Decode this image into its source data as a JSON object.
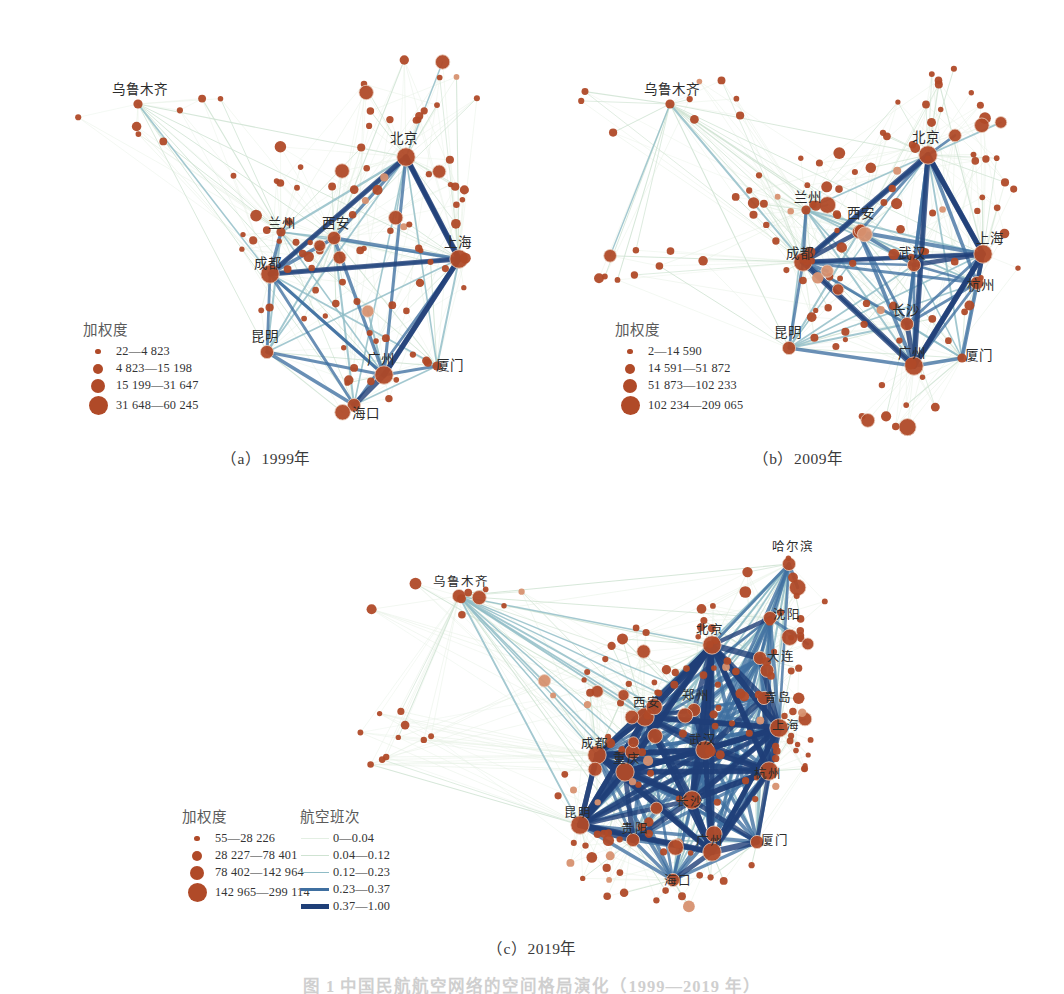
{
  "figure": {
    "caption": "图 1   中国民航航空网络的空间格局演化（1999—2019 年）",
    "panels": [
      {
        "id": "a",
        "caption": "（a）1999年",
        "year": 1999
      },
      {
        "id": "b",
        "caption": "（b）2009年",
        "year": 2009
      },
      {
        "id": "c",
        "caption": "（c）2019年",
        "year": 2019
      }
    ]
  },
  "colors": {
    "node_fill": "#b04a28",
    "node_fill_light": "#d79170",
    "edge_weak": "#cfe3d2",
    "edge_mid": "#8fbcc6",
    "edge_strong": "#3f6fa0",
    "edge_max": "#1f3f78",
    "label_text": "#2b2b2b",
    "legend_text": "#333333",
    "caption_text": "#3a3a3a"
  },
  "legends": {
    "panel_a": {
      "title": "加权度",
      "classes": [
        {
          "label": "22—4 823",
          "radius": 2.8,
          "min": 22,
          "max": 4823
        },
        {
          "label": "4 823—15 198",
          "radius": 5.0,
          "min": 4823,
          "max": 15198
        },
        {
          "label": "15 199—31 647",
          "radius": 7.0,
          "min": 15199,
          "max": 31647
        },
        {
          "label": "31 648—60 245",
          "radius": 9.5,
          "min": 31648,
          "max": 60245
        }
      ]
    },
    "panel_b": {
      "title": "加权度",
      "classes": [
        {
          "label": "2—14 590",
          "radius": 2.8,
          "min": 2,
          "max": 14590
        },
        {
          "label": "14 591—51 872",
          "radius": 5.0,
          "min": 14591,
          "max": 51872
        },
        {
          "label": "51 873—102 233",
          "radius": 7.0,
          "min": 51873,
          "max": 102233
        },
        {
          "label": "102 234—209 065",
          "radius": 9.5,
          "min": 102234,
          "max": 209065
        }
      ]
    },
    "panel_c_nodes": {
      "title": "加权度",
      "classes": [
        {
          "label": "55—28 226",
          "radius": 2.8,
          "min": 55,
          "max": 28226
        },
        {
          "label": "28 227—78 401",
          "radius": 5.0,
          "min": 28227,
          "max": 78401
        },
        {
          "label": "78 402—142 964",
          "radius": 7.0,
          "min": 78402,
          "max": 142964
        },
        {
          "label": "142 965—299 114",
          "radius": 9.5,
          "min": 142965,
          "max": 299114
        }
      ]
    },
    "panel_c_edges": {
      "title": "航空班次",
      "classes": [
        {
          "label": "0—0.04",
          "width": 0.7,
          "color": "#e3efe3",
          "min": 0,
          "max": 0.04
        },
        {
          "label": "0.04—0.12",
          "width": 1.1,
          "color": "#cfe3d2",
          "min": 0.04,
          "max": 0.12
        },
        {
          "label": "0.12—0.23",
          "width": 1.8,
          "color": "#8fbcc6",
          "min": 0.12,
          "max": 0.23
        },
        {
          "label": "0.23—0.37",
          "width": 3.4,
          "color": "#3f6fa0",
          "min": 0.23,
          "max": 0.37
        },
        {
          "label": "0.37—1.00",
          "width": 5.4,
          "color": "#1f3f78",
          "min": 0.37,
          "max": 1.0
        }
      ]
    }
  },
  "chart_data": {
    "type": "scatter",
    "title": "中国民航航空网络的空间格局演化（1999—2019 年）",
    "xlabel": "",
    "ylabel": "",
    "grid": false,
    "legend_position": "lower-left",
    "panels": [
      {
        "id": "a",
        "label": "（a）1999年",
        "labeled_cities": [
          {
            "name": "乌鲁木齐",
            "x": 138,
            "y": 104,
            "deg_class": 2,
            "lx": 140,
            "ly": 94,
            "anchor": "middle"
          },
          {
            "name": "北京",
            "x": 406,
            "y": 157,
            "deg_class": 4,
            "lx": 404,
            "ly": 143,
            "anchor": "middle"
          },
          {
            "name": "兰州",
            "x": 281,
            "y": 232,
            "deg_class": 2,
            "lx": 282,
            "ly": 228,
            "anchor": "middle"
          },
          {
            "name": "西安",
            "x": 334,
            "y": 238,
            "deg_class": 3,
            "lx": 336,
            "ly": 228,
            "anchor": "middle"
          },
          {
            "name": "成都",
            "x": 270,
            "y": 274,
            "deg_class": 4,
            "lx": 268,
            "ly": 268,
            "anchor": "middle"
          },
          {
            "name": "上海",
            "x": 459,
            "y": 259,
            "deg_class": 4,
            "lx": 458,
            "ly": 247,
            "anchor": "middle"
          },
          {
            "name": "昆明",
            "x": 267,
            "y": 352,
            "deg_class": 3,
            "lx": 265,
            "ly": 341,
            "anchor": "middle"
          },
          {
            "name": "广州",
            "x": 384,
            "y": 375,
            "deg_class": 4,
            "lx": 381,
            "ly": 364,
            "anchor": "middle"
          },
          {
            "name": "厦门",
            "x": 437,
            "y": 366,
            "deg_class": 2,
            "lx": 450,
            "ly": 370,
            "anchor": "middle"
          },
          {
            "name": "海口",
            "x": 354,
            "y": 405,
            "deg_class": 3,
            "lx": 366,
            "ly": 418,
            "anchor": "middle"
          }
        ],
        "node_count": 110,
        "edge_count": 520
      },
      {
        "id": "b",
        "label": "（b）2009年",
        "labeled_cities": [
          {
            "name": "乌鲁木齐",
            "x": 670,
            "y": 104,
            "deg_class": 2,
            "lx": 672,
            "ly": 94,
            "anchor": "middle"
          },
          {
            "name": "北京",
            "x": 928,
            "y": 155,
            "deg_class": 4,
            "lx": 926,
            "ly": 142,
            "anchor": "middle"
          },
          {
            "name": "兰州",
            "x": 806,
            "y": 210,
            "deg_class": 2,
            "lx": 808,
            "ly": 202,
            "anchor": "middle"
          },
          {
            "name": "西安",
            "x": 859,
            "y": 232,
            "deg_class": 3,
            "lx": 861,
            "ly": 218,
            "anchor": "middle"
          },
          {
            "name": "成都",
            "x": 803,
            "y": 262,
            "deg_class": 4,
            "lx": 800,
            "ly": 258,
            "anchor": "middle"
          },
          {
            "name": "上海",
            "x": 983,
            "y": 254,
            "deg_class": 4,
            "lx": 990,
            "ly": 243,
            "anchor": "middle"
          },
          {
            "name": "武汉",
            "x": 914,
            "y": 265,
            "deg_class": 3,
            "lx": 912,
            "ly": 258,
            "anchor": "middle"
          },
          {
            "name": "杭州",
            "x": 977,
            "y": 283,
            "deg_class": 3,
            "lx": 981,
            "ly": 290,
            "anchor": "middle"
          },
          {
            "name": "长沙",
            "x": 907,
            "y": 324,
            "deg_class": 3,
            "lx": 906,
            "ly": 315,
            "anchor": "middle"
          },
          {
            "name": "昆明",
            "x": 789,
            "y": 348,
            "deg_class": 3,
            "lx": 788,
            "ly": 337,
            "anchor": "middle"
          },
          {
            "name": "广州",
            "x": 914,
            "y": 366,
            "deg_class": 4,
            "lx": 912,
            "ly": 358,
            "anchor": "middle"
          },
          {
            "name": "厦门",
            "x": 962,
            "y": 358,
            "deg_class": 2,
            "lx": 979,
            "ly": 360,
            "anchor": "middle"
          }
        ],
        "node_count": 140,
        "edge_count": 880
      },
      {
        "id": "c",
        "label": "（c）2019年",
        "labeled_cities": [
          {
            "name": "乌鲁木齐",
            "x": 459,
            "y": 596,
            "deg_class": 3,
            "lx": 461,
            "ly": 586,
            "anchor": "middle"
          },
          {
            "name": "哈尔滨",
            "x": 789,
            "y": 564,
            "deg_class": 3,
            "lx": 793,
            "ly": 551,
            "anchor": "middle"
          },
          {
            "name": "沈阳",
            "x": 770,
            "y": 618,
            "deg_class": 3,
            "lx": 787,
            "ly": 619,
            "anchor": "middle"
          },
          {
            "name": "大连",
            "x": 760,
            "y": 658,
            "deg_class": 3,
            "lx": 781,
            "ly": 661,
            "anchor": "middle"
          },
          {
            "name": "北京",
            "x": 712,
            "y": 645,
            "deg_class": 4,
            "lx": 710,
            "ly": 634,
            "anchor": "middle"
          },
          {
            "name": "青岛",
            "x": 764,
            "y": 698,
            "deg_class": 3,
            "lx": 778,
            "ly": 702,
            "anchor": "middle"
          },
          {
            "name": "西安",
            "x": 645,
            "y": 717,
            "deg_class": 4,
            "lx": 647,
            "ly": 707,
            "anchor": "middle"
          },
          {
            "name": "郑州",
            "x": 694,
            "y": 710,
            "deg_class": 3,
            "lx": 696,
            "ly": 700,
            "anchor": "middle"
          },
          {
            "name": "上海",
            "x": 779,
            "y": 728,
            "deg_class": 4,
            "lx": 786,
            "ly": 730,
            "anchor": "middle"
          },
          {
            "name": "成都",
            "x": 597,
            "y": 755,
            "deg_class": 4,
            "lx": 595,
            "ly": 748,
            "anchor": "middle"
          },
          {
            "name": "重庆",
            "x": 625,
            "y": 772,
            "deg_class": 4,
            "lx": 627,
            "ly": 763,
            "anchor": "middle"
          },
          {
            "name": "武汉",
            "x": 705,
            "y": 750,
            "deg_class": 4,
            "lx": 703,
            "ly": 744,
            "anchor": "middle"
          },
          {
            "name": "杭州",
            "x": 769,
            "y": 771,
            "deg_class": 4,
            "lx": 768,
            "ly": 778,
            "anchor": "middle"
          },
          {
            "name": "长沙",
            "x": 692,
            "y": 800,
            "deg_class": 4,
            "lx": 690,
            "ly": 806,
            "anchor": "middle"
          },
          {
            "name": "昆明",
            "x": 580,
            "y": 825,
            "deg_class": 4,
            "lx": 578,
            "ly": 817,
            "anchor": "middle"
          },
          {
            "name": "贵阳",
            "x": 633,
            "y": 840,
            "deg_class": 3,
            "lx": 635,
            "ly": 833,
            "anchor": "middle"
          },
          {
            "name": "广州",
            "x": 712,
            "y": 852,
            "deg_class": 4,
            "lx": 710,
            "ly": 845,
            "anchor": "middle"
          },
          {
            "name": "厦门",
            "x": 757,
            "y": 842,
            "deg_class": 3,
            "lx": 775,
            "ly": 845,
            "anchor": "middle"
          },
          {
            "name": "海口",
            "x": 673,
            "y": 880,
            "deg_class": 3,
            "lx": 678,
            "ly": 885,
            "anchor": "middle"
          }
        ],
        "node_count": 190,
        "edge_count": 1600
      }
    ]
  }
}
